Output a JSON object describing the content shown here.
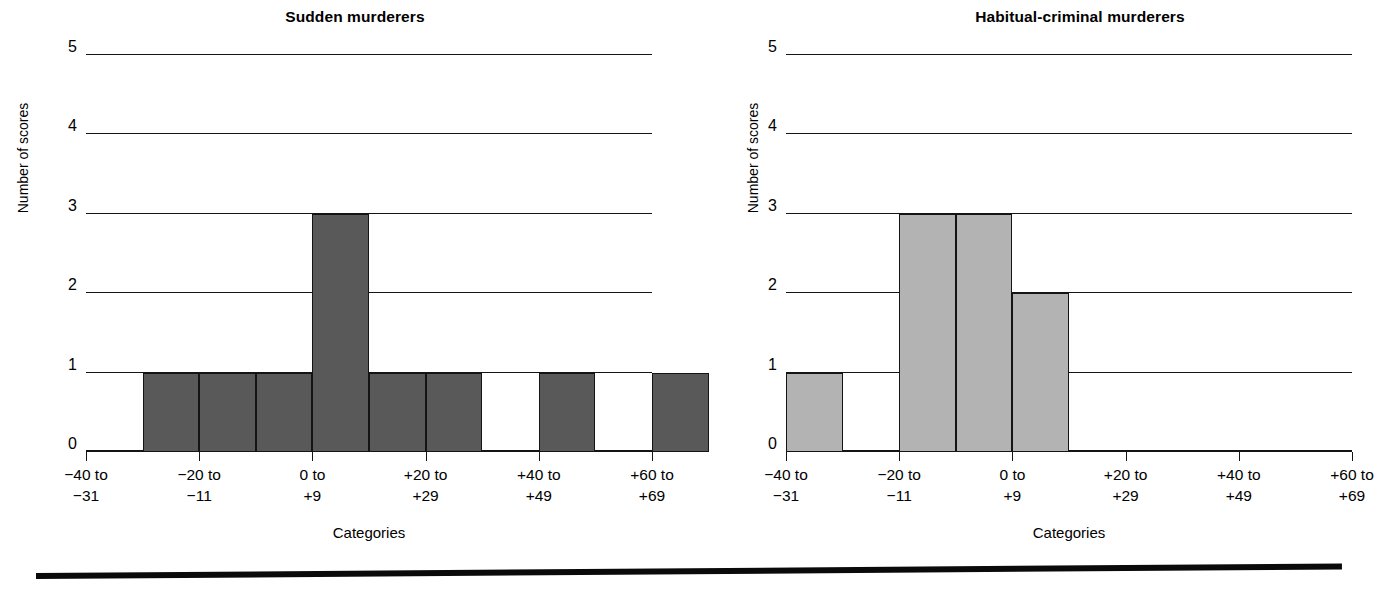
{
  "figure": {
    "bottom_rule": "horizontal-rule"
  },
  "chart_data": [
    {
      "type": "bar",
      "title": "Sudden murderers",
      "xlabel": "Categories",
      "ylabel": "Number of scores",
      "ylim": [
        0,
        5
      ],
      "yticks": [
        "0",
        "1",
        "2",
        "3",
        "4",
        "5"
      ],
      "grid": true,
      "legend": "none",
      "bar_color": "#595959",
      "categories": [
        "−40 to −31",
        "−20 to −11",
        "0 to +9",
        "+20 to +29",
        "+40 to +49",
        "+60 to +69"
      ],
      "bin_slots": 10,
      "values": [
        0,
        1,
        1,
        1,
        3,
        1,
        1,
        0,
        1,
        0,
        1
      ],
      "slot_values": [
        0,
        1,
        1,
        1,
        3,
        1,
        1,
        0,
        1,
        0,
        1
      ],
      "notes": "Histogram drawn with half-width bins; bar occupies alternating half category widths."
    },
    {
      "type": "bar",
      "title": "Habitual-criminal murderers",
      "xlabel": "Categories",
      "ylabel": "Number of scores",
      "ylim": [
        0,
        5
      ],
      "yticks": [
        "0",
        "1",
        "2",
        "3",
        "4",
        "5"
      ],
      "grid": true,
      "legend": "none",
      "bar_color": "#b3b3b3",
      "categories": [
        "−40 to −31",
        "−20 to −11",
        "0 to +9",
        "+20 to +29",
        "+40 to +49",
        "+60 to +69"
      ],
      "bin_slots": 10,
      "slot_values": [
        1,
        0,
        3,
        3,
        2,
        0,
        0,
        0,
        0,
        0,
        0
      ],
      "notes": "Histogram drawn with half-width bins."
    }
  ],
  "left": {
    "title": "Sudden murderers",
    "ylabel": "Number of scores",
    "xlabel": "Categories",
    "yticks": [
      "5",
      "4",
      "3",
      "2",
      "1",
      "0"
    ],
    "xticks": [
      {
        "l1": "−40 to",
        "l2": "−31"
      },
      {
        "l1": "−20 to",
        "l2": "−11"
      },
      {
        "l1": "0 to",
        "l2": "+9"
      },
      {
        "l1": "+20 to",
        "l2": "+29"
      },
      {
        "l1": "+40 to",
        "l2": "+49"
      },
      {
        "l1": "+60 to",
        "l2": "+69"
      }
    ]
  },
  "right": {
    "title": "Habitual-criminal murderers",
    "ylabel": "Number of scores",
    "xlabel": "Categories",
    "yticks": [
      "5",
      "4",
      "3",
      "2",
      "1",
      "0"
    ],
    "xticks": [
      {
        "l1": "−40 to",
        "l2": "−31"
      },
      {
        "l1": "−20 to",
        "l2": "−11"
      },
      {
        "l1": "0 to",
        "l2": "+9"
      },
      {
        "l1": "+20 to",
        "l2": "+29"
      },
      {
        "l1": "+40 to",
        "l2": "+49"
      },
      {
        "l1": "+60 to",
        "l2": "+69"
      }
    ]
  }
}
